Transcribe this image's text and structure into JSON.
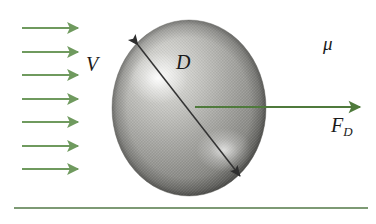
{
  "figure": {
    "background_color": "#ffffff",
    "width": 376,
    "height": 224
  },
  "labels": {
    "velocity": "V",
    "diameter": "D",
    "viscosity": "μ",
    "drag_force": "F",
    "drag_force_subscript": "D"
  },
  "colors": {
    "flow_arrow": "#6f9a5e",
    "drag_arrow": "#4f7a3c",
    "ground_line": "#7d9a74",
    "diameter_arrow": "#333333",
    "sphere_light": "#d9d9d6",
    "sphere_mid": "#9a9a97",
    "sphere_dark": "#4e4e4c"
  },
  "flow_arrows": {
    "count": 7,
    "x_start": 22,
    "x_end": 78,
    "y_positions": [
      28,
      52,
      75,
      99,
      122,
      146,
      169
    ]
  },
  "sphere": {
    "center_x": 189,
    "center_y": 108,
    "radius_x": 77,
    "radius_y": 88
  },
  "diameter_arrow": {
    "x1": 138,
    "y1": 45,
    "x2": 240,
    "y2": 176,
    "double_headed": true
  },
  "drag_arrow": {
    "x_start": 195,
    "x_end": 360,
    "y": 107
  },
  "ground_line": {
    "x1": 14,
    "x2": 368,
    "y": 208
  }
}
